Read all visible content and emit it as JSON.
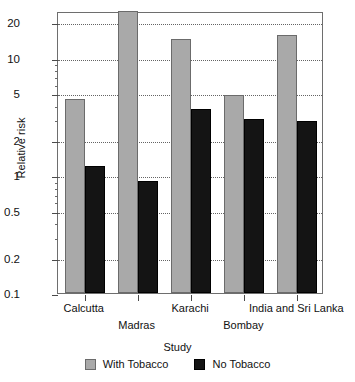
{
  "chart_data": {
    "type": "bar",
    "title": "",
    "subtitle": "",
    "xlabel": "Study",
    "ylabel": "Relative risk",
    "yscale": "log",
    "ylim": [
      0.1,
      25
    ],
    "grid": true,
    "legend_position": "bottom",
    "categories": [
      "Calcutta",
      "Madras",
      "Karachi",
      "Bombay",
      "India and Sri Lanka"
    ],
    "ytick_labels": [
      "20",
      "10",
      "5",
      "2",
      "1",
      "0.5",
      "0.2",
      "0.1"
    ],
    "ytick_values": [
      20,
      10,
      5,
      2,
      1,
      0.5,
      0.2,
      0.1
    ],
    "series": [
      {
        "name": "With Tobacco",
        "color": "#a9a9a9",
        "values": [
          4.5,
          25.0,
          14.5,
          4.8,
          15.5
        ]
      },
      {
        "name": "No Tobacco",
        "color": "#141414",
        "values": [
          1.2,
          0.9,
          3.7,
          3.0,
          2.9
        ]
      }
    ]
  },
  "legend": {
    "items": [
      {
        "label": "With Tobacco",
        "swatch": "gray-swatch-icon"
      },
      {
        "label": "No Tobacco",
        "swatch": "black-swatch-icon"
      }
    ]
  }
}
